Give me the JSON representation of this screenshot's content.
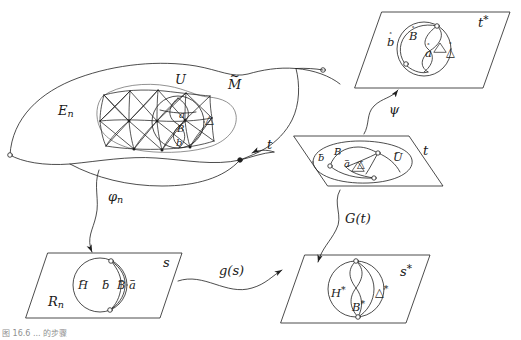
{
  "figure": {
    "caption": "图 16.6  ...  的步骤",
    "stroke_color": "#1f1f1f",
    "accent_color": "#555555"
  },
  "manifold": {
    "name": "M-tilde",
    "label_M": "M",
    "label_M_accent": "~",
    "label_En_base": "E",
    "label_En_sub": "n",
    "label_U": "U",
    "inner": {
      "label_a": "a",
      "label_b": "b",
      "label_B": "B",
      "label_delta": "△"
    }
  },
  "planes": {
    "t_star": {
      "corner_label": "t",
      "corner_star": "*",
      "items": [
        {
          "name": "b-ring",
          "base": "b",
          "accent": "˚"
        },
        {
          "name": "B-ring",
          "base": "B",
          "accent": "˚"
        },
        {
          "name": "a-ring",
          "base": "a",
          "accent": "˚"
        },
        {
          "name": "delta-ring",
          "base": "△",
          "accent": "˚"
        }
      ]
    },
    "t": {
      "corner_label": "t",
      "items": [
        {
          "name": "b-bar",
          "base": "b",
          "accent": "–"
        },
        {
          "name": "B-bar",
          "base": "B",
          "accent": "–"
        },
        {
          "name": "a-bar",
          "base": "a",
          "accent": "–"
        },
        {
          "name": "delta-bar",
          "base": "△",
          "accent": "–"
        },
        {
          "name": "U-bar",
          "base": "U",
          "accent": "–"
        }
      ]
    },
    "s": {
      "corner_label": "s",
      "label_Rn_base": "R",
      "label_Rn_sub": "n",
      "items": [
        {
          "name": "H-bar",
          "base": "H",
          "accent": "–"
        },
        {
          "name": "b-bar",
          "base": "b",
          "accent": "–"
        },
        {
          "name": "B-bar",
          "base": "B",
          "accent": "–"
        },
        {
          "name": "a-bar",
          "base": "a",
          "accent": "–"
        }
      ]
    },
    "s_star": {
      "corner_label": "s",
      "corner_star": "*",
      "items": [
        {
          "name": "H-star",
          "base": "H",
          "star": "*"
        },
        {
          "name": "B-star",
          "base": "B",
          "star": "*"
        },
        {
          "name": "delta-star",
          "base": "△",
          "star": "*"
        }
      ]
    }
  },
  "arrows": [
    {
      "name": "arrow-t",
      "label": "t"
    },
    {
      "name": "arrow-psi",
      "label": "ψ"
    },
    {
      "name": "arrow-phi-n",
      "label_base": "φ",
      "label_sub": "n"
    },
    {
      "name": "arrow-G-of-t",
      "label": "G(t)"
    },
    {
      "name": "arrow-g-of-s",
      "label": "g(s)"
    }
  ]
}
